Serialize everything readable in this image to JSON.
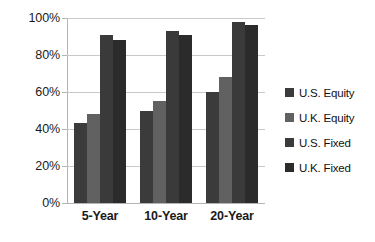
{
  "chart_data": {
    "type": "bar",
    "title": "",
    "subtitle": "",
    "xlabel": "",
    "ylabel": "",
    "categories": [
      "5-Year",
      "10-Year",
      "20-Year"
    ],
    "series": [
      {
        "name": "U.S. Equity",
        "color": "#3b3b3b",
        "values": [
          43,
          50,
          60
        ]
      },
      {
        "name": "U.K. Equity",
        "color": "#616161",
        "values": [
          48,
          55,
          68
        ]
      },
      {
        "name": "U.S. Fixed",
        "color": "#3a3a3a",
        "values": [
          91,
          93,
          98
        ]
      },
      {
        "name": "U.K. Fixed",
        "color": "#2b2b2b",
        "values": [
          88,
          91,
          96
        ]
      }
    ],
    "ylim": [
      0,
      100
    ],
    "ytick_labels": [
      "0%",
      "20%",
      "40%",
      "60%",
      "80%",
      "100%"
    ],
    "ytick_values": [
      0,
      20,
      40,
      60,
      80,
      100
    ],
    "grid": true,
    "legend_position": "right",
    "value_suffix": "%"
  },
  "colors": {
    "background": "#ffffff",
    "gridline": "#c9c9c9",
    "axis": "#b4b4b4",
    "text": "#1a1a1a"
  }
}
